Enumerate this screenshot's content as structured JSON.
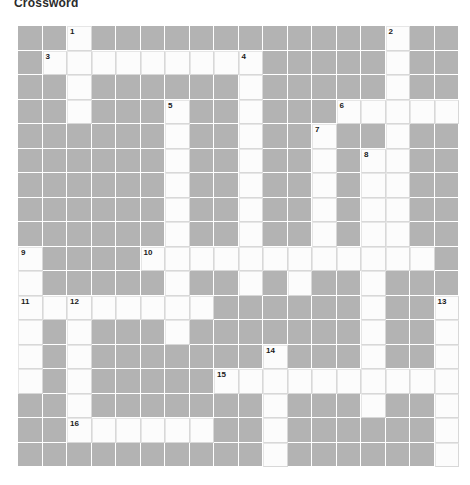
{
  "title": "Crossword",
  "grid": {
    "columns": 18,
    "rows": 18,
    "cell_size_px": 24.5,
    "block_color": "#b3b3b3",
    "open_color": "#fcfcfc",
    "grid_line_color": "#d8d8d8",
    "number_color": "#1a1a1a",
    "open_cells": [
      [
        2,
        0
      ],
      [
        15,
        0
      ],
      [
        1,
        1
      ],
      [
        2,
        1
      ],
      [
        3,
        1
      ],
      [
        4,
        1
      ],
      [
        5,
        1
      ],
      [
        6,
        1
      ],
      [
        7,
        1
      ],
      [
        8,
        1
      ],
      [
        9,
        1
      ],
      [
        15,
        1
      ],
      [
        2,
        2
      ],
      [
        9,
        2
      ],
      [
        15,
        2
      ],
      [
        2,
        3
      ],
      [
        6,
        3
      ],
      [
        9,
        3
      ],
      [
        13,
        3
      ],
      [
        14,
        3
      ],
      [
        15,
        3
      ],
      [
        16,
        3
      ],
      [
        17,
        3
      ],
      [
        6,
        4
      ],
      [
        9,
        4
      ],
      [
        12,
        4
      ],
      [
        15,
        4
      ],
      [
        6,
        5
      ],
      [
        9,
        5
      ],
      [
        12,
        5
      ],
      [
        14,
        5
      ],
      [
        15,
        5
      ],
      [
        6,
        6
      ],
      [
        9,
        6
      ],
      [
        12,
        6
      ],
      [
        14,
        6
      ],
      [
        15,
        6
      ],
      [
        6,
        7
      ],
      [
        9,
        7
      ],
      [
        12,
        7
      ],
      [
        14,
        7
      ],
      [
        15,
        7
      ],
      [
        6,
        8
      ],
      [
        9,
        8
      ],
      [
        12,
        8
      ],
      [
        14,
        8
      ],
      [
        15,
        8
      ],
      [
        0,
        9
      ],
      [
        5,
        9
      ],
      [
        6,
        9
      ],
      [
        7,
        9
      ],
      [
        8,
        9
      ],
      [
        9,
        9
      ],
      [
        10,
        9
      ],
      [
        11,
        9
      ],
      [
        12,
        9
      ],
      [
        13,
        9
      ],
      [
        14,
        9
      ],
      [
        15,
        9
      ],
      [
        16,
        9
      ],
      [
        0,
        10
      ],
      [
        6,
        10
      ],
      [
        9,
        10
      ],
      [
        11,
        10
      ],
      [
        14,
        10
      ],
      [
        0,
        11
      ],
      [
        1,
        11
      ],
      [
        2,
        11
      ],
      [
        3,
        11
      ],
      [
        4,
        11
      ],
      [
        5,
        11
      ],
      [
        6,
        11
      ],
      [
        7,
        11
      ],
      [
        14,
        11
      ],
      [
        17,
        11
      ],
      [
        0,
        12
      ],
      [
        2,
        12
      ],
      [
        6,
        12
      ],
      [
        14,
        12
      ],
      [
        17,
        12
      ],
      [
        0,
        13
      ],
      [
        2,
        13
      ],
      [
        10,
        13
      ],
      [
        14,
        13
      ],
      [
        17,
        13
      ],
      [
        0,
        14
      ],
      [
        2,
        14
      ],
      [
        8,
        14
      ],
      [
        9,
        14
      ],
      [
        10,
        14
      ],
      [
        11,
        14
      ],
      [
        12,
        14
      ],
      [
        13,
        14
      ],
      [
        14,
        14
      ],
      [
        15,
        14
      ],
      [
        16,
        14
      ],
      [
        17,
        14
      ],
      [
        2,
        15
      ],
      [
        10,
        15
      ],
      [
        14,
        15
      ],
      [
        17,
        15
      ],
      [
        2,
        16
      ],
      [
        3,
        16
      ],
      [
        4,
        16
      ],
      [
        5,
        16
      ],
      [
        6,
        16
      ],
      [
        7,
        16
      ],
      [
        10,
        16
      ],
      [
        17,
        16
      ],
      [
        10,
        17
      ],
      [
        17,
        17
      ]
    ],
    "numbered_cells": [
      {
        "number": "1",
        "col": 2,
        "row": 0
      },
      {
        "number": "2",
        "col": 15,
        "row": 0
      },
      {
        "number": "3",
        "col": 1,
        "row": 1
      },
      {
        "number": "4",
        "col": 9,
        "row": 1
      },
      {
        "number": "5",
        "col": 6,
        "row": 3
      },
      {
        "number": "6",
        "col": 13,
        "row": 3
      },
      {
        "number": "7",
        "col": 12,
        "row": 4
      },
      {
        "number": "8",
        "col": 14,
        "row": 5
      },
      {
        "number": "9",
        "col": 0,
        "row": 9
      },
      {
        "number": "10",
        "col": 5,
        "row": 9
      },
      {
        "number": "11",
        "col": 0,
        "row": 11
      },
      {
        "number": "12",
        "col": 2,
        "row": 11
      },
      {
        "number": "13",
        "col": 17,
        "row": 11
      },
      {
        "number": "14",
        "col": 10,
        "row": 13
      },
      {
        "number": "15",
        "col": 8,
        "row": 14
      },
      {
        "number": "16",
        "col": 2,
        "row": 16
      }
    ]
  }
}
